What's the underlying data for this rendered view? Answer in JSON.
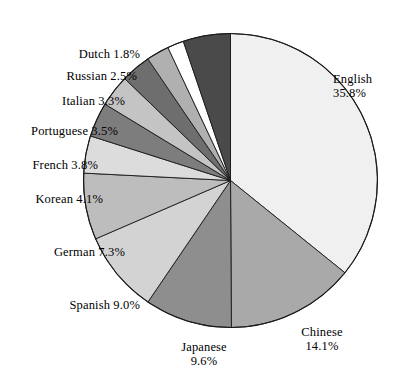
{
  "chart_data": {
    "type": "pie",
    "title": "",
    "subtitle": "",
    "xlabel": "",
    "ylabel": "",
    "legend_position": "outside-labels",
    "grid": false,
    "units": "percent",
    "start_angle_deg": 0,
    "direction": "clockwise",
    "categories": [
      "English",
      "Chinese",
      "Japanese",
      "Spanish",
      "German",
      "Korean",
      "French",
      "Portuguese",
      "Italian",
      "Russian",
      "Dutch",
      "Other"
    ],
    "values": [
      35.8,
      14.1,
      9.6,
      9.0,
      7.3,
      4.1,
      3.8,
      3.5,
      3.3,
      2.5,
      1.8,
      5.2
    ],
    "slices": [
      {
        "label": "English",
        "value": 35.8,
        "value_text": "35.8%",
        "color": "#f0f0f0"
      },
      {
        "label": "Chinese",
        "value": 14.1,
        "value_text": "14.1%",
        "color": "#a9a9a9"
      },
      {
        "label": "Japanese",
        "value": 9.6,
        "value_text": "9.6%",
        "color": "#8e8e8e"
      },
      {
        "label": "Spanish",
        "value": 9.0,
        "value_text": "9.0%",
        "color": "#d3d3d3"
      },
      {
        "label": "German",
        "value": 7.3,
        "value_text": "7.3%",
        "color": "#bdbdbd"
      },
      {
        "label": "Korean",
        "value": 4.1,
        "value_text": "4.1%",
        "color": "#dcdcdc"
      },
      {
        "label": "French",
        "value": 3.8,
        "value_text": "3.8%",
        "color": "#7d7d7d"
      },
      {
        "label": "Portuguese",
        "value": 3.5,
        "value_text": "3.5%",
        "color": "#c4c4c4"
      },
      {
        "label": "Italian",
        "value": 3.3,
        "value_text": "3.3%",
        "color": "#6e6e6e"
      },
      {
        "label": "Russian",
        "value": 2.5,
        "value_text": "2.5%",
        "color": "#b0b0b0"
      },
      {
        "label": "Dutch",
        "value": 1.8,
        "value_text": "1.8%",
        "color": "#ffffff"
      },
      {
        "label": "Other",
        "value": 5.2,
        "value_text": "",
        "color": "#4a4a4a"
      }
    ]
  },
  "labels": {
    "english": {
      "name": "English",
      "value": "35.8%"
    },
    "chinese": {
      "name": "Chinese",
      "value": "14.1%"
    },
    "japanese": {
      "name": "Japanese",
      "value": "9.6%"
    },
    "spanish": {
      "text": "Spanish 9.0%"
    },
    "german": {
      "text": "German 7.3%"
    },
    "korean": {
      "text": "Korean 4.1%"
    },
    "french": {
      "text": "French 3.8%"
    },
    "portuguese": {
      "text": "Portuguese 3.5%"
    },
    "italian": {
      "text": "Italian 3.3%"
    },
    "russian": {
      "text": "Russian 2.5%"
    },
    "dutch": {
      "text": "Dutch 1.8%"
    }
  },
  "style": {
    "background": "#ffffff",
    "outline": "#1a1a1a",
    "text": "#000000"
  }
}
